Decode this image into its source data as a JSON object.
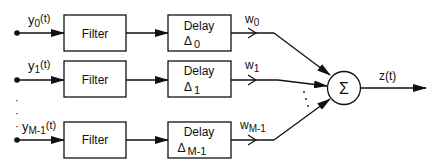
{
  "diagram": {
    "channels": [
      {
        "input_label": "y",
        "input_sub": "0",
        "input_suffix": "(t)",
        "filter_label": "Filter",
        "delay_label": "Delay",
        "delay_symbol": "Δ",
        "delay_sub": "0",
        "weight_label": "w",
        "weight_sub": "0"
      },
      {
        "input_label": "y",
        "input_sub": "1",
        "input_suffix": "(t)",
        "filter_label": "Filter",
        "delay_label": "Delay",
        "delay_symbol": "Δ",
        "delay_sub": "1",
        "weight_label": "w",
        "weight_sub": "1"
      },
      {
        "input_label": "y",
        "input_sub": "M-1",
        "input_suffix": "(t)",
        "filter_label": "Filter",
        "delay_label": "Delay",
        "delay_symbol": "Δ",
        "delay_sub": "M-1",
        "weight_label": "w",
        "weight_sub": "M-1"
      }
    ],
    "summer_symbol": "Σ",
    "output_label": "z(t)",
    "ellipsis": "·"
  }
}
